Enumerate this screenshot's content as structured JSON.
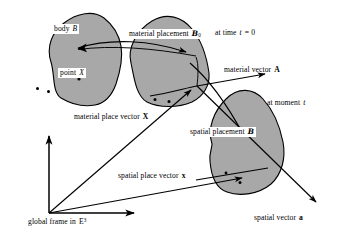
{
  "figure": {
    "type": "continuum-mechanics-placement-diagram",
    "background_color": "#ffffff",
    "blob_fill_color": "#a8a8a8",
    "blob_stroke_color": "#000000"
  },
  "labels": {
    "body": {
      "prefix": "body",
      "symbol": "B"
    },
    "point": {
      "prefix": "point",
      "symbol": "X"
    },
    "material_placement": {
      "prefix": "material placement",
      "symbol": "B",
      "subscript": "0"
    },
    "at_time_zero": {
      "prefix": "at time",
      "symbol": "t",
      "equals": "= 0"
    },
    "material_vector": {
      "prefix": "material vector",
      "symbol": "A"
    },
    "at_moment_t": {
      "prefix": "at moment",
      "symbol": "t"
    },
    "material_place_vector": {
      "prefix": "material place vector",
      "symbol": "X"
    },
    "spatial_placement": {
      "prefix": "spatial placement",
      "symbol": "B"
    },
    "spatial_place_vector": {
      "prefix": "spatial place vector",
      "symbol": "x"
    },
    "global_frame": {
      "prefix": "global frame in",
      "symbol": "E",
      "superscript": "3"
    },
    "spatial_vector": {
      "prefix": "spatial vector",
      "symbol": "a"
    }
  },
  "geometry": {
    "blobs": [
      {
        "name": "body-blob",
        "path": "M 51,62 C 47,48 52,33 64,24 C 76,14 92,11 103,18 C 112,24 118,34 120,45 C 122,56 119,71 115,83 C 111,94 106,102 96,104 C 85,106 72,104 62,98 C 53,92 55,74 51,62 Z",
        "dots": [
          [
            37,
            88
          ],
          [
            48,
            91
          ],
          [
            79,
            79
          ]
        ]
      },
      {
        "name": "material-placement-blob",
        "path": "M 131,62 C 128,48 137,31 152,22 C 166,13 181,17 191,29 C 201,41 207,59 208,72 C 209,84 204,95 192,101 C 179,107 160,108 148,102 C 137,96 134,76 131,62 Z",
        "dots": [
          [
            155,
            99
          ],
          [
            169,
            101
          ]
        ]
      },
      {
        "name": "spatial-placement-blob",
        "path": "M 212,143 C 208,128 214,111 226,99 C 238,88 252,89 262,99 C 272,109 279,126 282,141 C 285,157 282,173 272,183 C 261,193 241,197 228,193 C 216,189 212,175 210,161 C 209,153 212,148 212,143 Z",
        "dots": [
          [
            226,
            173
          ],
          [
            240,
            182
          ]
        ]
      }
    ],
    "vectors": [
      {
        "name": "material-placement-arrow",
        "from": [
          75,
          47
        ],
        "to": [
          196,
          54
        ]
      },
      {
        "name": "material-vector-A-arrow",
        "from": [
          197,
          86
        ],
        "to": [
          272,
          73
        ]
      },
      {
        "name": "material-place-vector-X-arrow",
        "from": [
          49,
          213
        ],
        "to": [
          196,
          86
        ]
      },
      {
        "name": "spatial-place-vector-x-arrow",
        "from": [
          49,
          213
        ],
        "to": [
          249,
          177
        ]
      },
      {
        "name": "spatial-vector-a-arrow",
        "from": [
          196,
          86
        ],
        "to": [
          323,
          208
        ]
      },
      {
        "name": "spatial-placement-arrow",
        "from": [
          197,
          86
        ],
        "to": [
          249,
          141
        ]
      }
    ],
    "axes": [
      {
        "name": "vertical-axis",
        "from": [
          49,
          213
        ],
        "to": [
          49,
          132
        ]
      },
      {
        "name": "horizontal-axis",
        "from": [
          49,
          213
        ],
        "to": [
          140,
          213
        ]
      }
    ]
  }
}
